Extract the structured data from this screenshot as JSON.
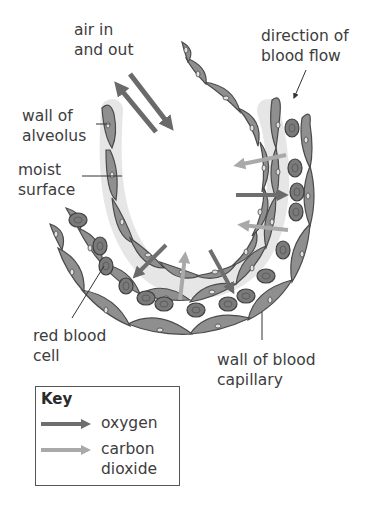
{
  "diagram": {
    "labels": {
      "air": [
        "air in",
        "and out"
      ],
      "blood_flow": [
        "direction of",
        "blood flow"
      ],
      "wall_alveolus": [
        "wall of",
        "alveolus"
      ],
      "moist_surface": [
        "moist",
        "surface"
      ],
      "red_blood_cell": [
        "red blood",
        "cell"
      ],
      "capillary_wall": [
        "wall of blood",
        "capillary"
      ]
    },
    "key": {
      "title": "Key",
      "items": [
        {
          "label": "oxygen",
          "color": "#6e6e6e"
        },
        {
          "label": "carbon dioxide",
          "line1": "carbon",
          "line2": "dioxide",
          "color": "#a9a9a9"
        }
      ]
    },
    "colors": {
      "cell_fill": "#8f8f8f",
      "cell_outline": "#4a4a4a",
      "rbc_fill": "#7a7a7a",
      "moist_layer": "#e8e8e8",
      "oxygen_arrow": "#6e6e6e",
      "co2_arrow": "#a9a9a9",
      "air_arrow": "#6a6a6a"
    }
  }
}
